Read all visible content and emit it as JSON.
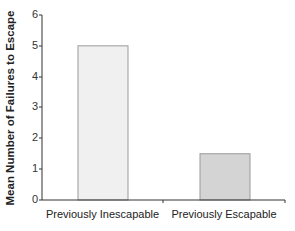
{
  "chart_data": {
    "type": "bar",
    "title": "",
    "xlabel": "",
    "ylabel": "Mean Number of Failures to Escape",
    "categories": [
      "Previously Inescapable",
      "Previously Escapable"
    ],
    "values": [
      5,
      1.5
    ],
    "ylim": [
      0,
      6
    ],
    "yticks": [
      "0",
      "1",
      "2",
      "3",
      "4",
      "5",
      "6"
    ],
    "grid": false,
    "legend": null,
    "bar_colors": [
      "#f0f0f0",
      "#d4d4d4"
    ],
    "bar_border": "#999999"
  }
}
